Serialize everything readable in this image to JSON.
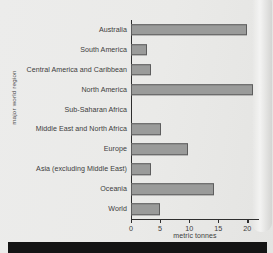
{
  "chart_data": {
    "type": "bar",
    "orientation": "horizontal",
    "title": "",
    "xlabel": "metric tonnes",
    "ylabel": "major world region",
    "xlim": [
      0,
      22
    ],
    "xticks": [
      0,
      5,
      10,
      15,
      20
    ],
    "xtick_labels": [
      "0",
      "5",
      "10",
      "15",
      "20"
    ],
    "grid": false,
    "legend": null,
    "categories": [
      "Australia",
      "South America",
      "Central America and Caribbean",
      "North America",
      "Sub-Saharan Africa",
      "Middle East and North Africa",
      "Europe",
      "Asia (excluding Middle East)",
      "Oceania",
      "World"
    ],
    "values": [
      20.0,
      2.8,
      3.5,
      21.0,
      0.0,
      5.2,
      9.8,
      3.5,
      14.3,
      4.9
    ],
    "bar_color": "#9a9b9a",
    "bar_edge_color": "#5d5d5d",
    "axis_color": "#2e2e2e"
  },
  "page": {
    "background_color": "#eaeae8",
    "bottom_strip_color": "#141414"
  }
}
